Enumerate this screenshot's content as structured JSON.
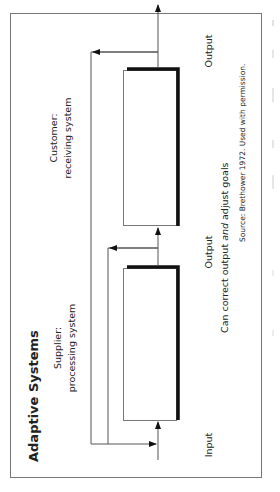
{
  "diagram": {
    "title": "Adaptive Systems",
    "orientation": "rotated 90° counter-clockwise",
    "systems": [
      {
        "id": "supplier",
        "label_line1": "Supplier:",
        "label_line2": "processing system"
      },
      {
        "id": "customer",
        "label_line1": "Customer:",
        "label_line2": "receiving system"
      }
    ],
    "flow_labels": {
      "input": "Input",
      "output_1": "Output",
      "output_2": "Output"
    },
    "caption": {
      "before": "Can correct output ",
      "emphasis": "and",
      "after": " adjust goals"
    },
    "source": "Source: Brethower 1972. Used with permission.",
    "colors": {
      "line": "#555555",
      "thick_border": "#111111",
      "frame": "#777777",
      "text": "#222222"
    }
  }
}
